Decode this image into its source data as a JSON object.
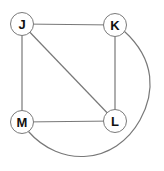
{
  "graph": {
    "type": "undirected-graph",
    "title": "",
    "nodes": [
      {
        "id": "J",
        "label": "J",
        "x": 22,
        "y": 24
      },
      {
        "id": "K",
        "label": "K",
        "x": 115,
        "y": 25
      },
      {
        "id": "M",
        "label": "M",
        "x": 22,
        "y": 122
      },
      {
        "id": "L",
        "label": "L",
        "x": 115,
        "y": 121
      }
    ],
    "edges": [
      {
        "from": "J",
        "to": "K",
        "shape": "straight"
      },
      {
        "from": "J",
        "to": "M",
        "shape": "straight"
      },
      {
        "from": "J",
        "to": "L",
        "shape": "straight-diagonal"
      },
      {
        "from": "K",
        "to": "L",
        "shape": "straight"
      },
      {
        "from": "M",
        "to": "L",
        "shape": "straight"
      },
      {
        "from": "M",
        "to": "K",
        "shape": "curved-around-bottom-right"
      }
    ]
  },
  "colors": {
    "background": "#ffffff",
    "node_fill": "#ffffff",
    "node_stroke": "#7a7a7a",
    "edge_stroke": "#787878",
    "label_text": "#111111"
  }
}
